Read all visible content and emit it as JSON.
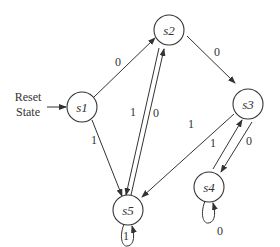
{
  "diagram": {
    "type": "finite-state-machine",
    "reset": {
      "line1": "Reset",
      "line2": "State",
      "target": "s1"
    },
    "states": [
      {
        "id": "s1",
        "label": "s1"
      },
      {
        "id": "s2",
        "label": "s2"
      },
      {
        "id": "s3",
        "label": "s3"
      },
      {
        "id": "s4",
        "label": "s4"
      },
      {
        "id": "s5",
        "label": "s5"
      }
    ],
    "transitions": [
      {
        "from": "s1",
        "to": "s2",
        "label": "0"
      },
      {
        "from": "s1",
        "to": "s5",
        "label": "1"
      },
      {
        "from": "s2",
        "to": "s3",
        "label": "0"
      },
      {
        "from": "s2",
        "to": "s5",
        "label": "1"
      },
      {
        "from": "s5",
        "to": "s2",
        "label": "0"
      },
      {
        "from": "s3",
        "to": "s5",
        "label": "1"
      },
      {
        "from": "s3",
        "to": "s4",
        "label": "0"
      },
      {
        "from": "s4",
        "to": "s3",
        "label": "1"
      },
      {
        "from": "s5",
        "to": "s5",
        "label": "1"
      },
      {
        "from": "s4",
        "to": "s4",
        "label": "0"
      }
    ]
  }
}
